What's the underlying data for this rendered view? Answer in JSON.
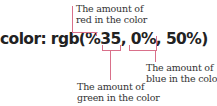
{
  "code": "color: rgb(%35, 0%, 50%)",
  "accent_color": "#d9708a",
  "annotations": {
    "red": {
      "line1": "The amount of",
      "line2": "red in the color"
    },
    "green": {
      "line1": "The amount of",
      "line2": "green in the color"
    },
    "blue": {
      "line1": "The amount of",
      "line2": "blue in the color"
    }
  }
}
